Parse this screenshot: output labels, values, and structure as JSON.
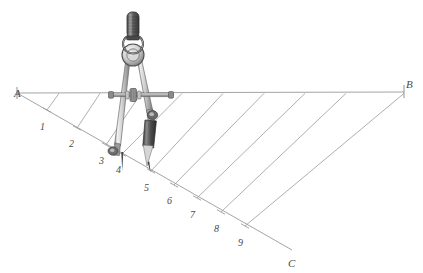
{
  "figure": {
    "background_color": "#ffffff",
    "line_color": "#9a9a9a",
    "label_color": "#4a4a4a",
    "instrument": "compass-divider"
  },
  "points": {
    "a": {
      "label": "A",
      "x": 14,
      "y": 88
    },
    "b": {
      "label": "B",
      "x": 406,
      "y": 79
    },
    "c": {
      "label": "C",
      "x": 288,
      "y": 258
    }
  },
  "segment_ab": {
    "x1": 17,
    "y1": 93,
    "x2": 404,
    "y2": 92
  },
  "ray_ac": {
    "x1": 17,
    "y1": 93,
    "x2": 292,
    "y2": 250
  },
  "divisions": [
    {
      "label": "1",
      "tick_x": 47,
      "tick_y": 110,
      "label_x": 40,
      "label_y": 122,
      "ab_x": 59
    },
    {
      "label": "2",
      "tick_x": 77,
      "tick_y": 128,
      "label_x": 69,
      "label_y": 139,
      "ab_x": 100
    },
    {
      "label": "3",
      "tick_x": 106,
      "tick_y": 145,
      "label_x": 99,
      "label_y": 156,
      "ab_x": 141
    },
    {
      "label": "4",
      "tick_x": 122,
      "tick_y": 154,
      "label_x": 116,
      "label_y": 165,
      "ab_x": 182
    },
    {
      "label": "5",
      "tick_x": 151,
      "tick_y": 171,
      "label_x": 144,
      "label_y": 183,
      "ab_x": 223
    },
    {
      "label": "6",
      "tick_x": 174,
      "tick_y": 185,
      "label_x": 167,
      "label_y": 196,
      "ab_x": 264
    },
    {
      "label": "7",
      "tick_x": 197,
      "tick_y": 198,
      "label_x": 190,
      "label_y": 210,
      "ab_x": 305
    },
    {
      "label": "8",
      "tick_x": 221,
      "tick_y": 212,
      "label_x": 214,
      "label_y": 224,
      "ab_x": 346
    },
    {
      "label": "9",
      "tick_x": 245,
      "tick_y": 226,
      "label_x": 238,
      "label_y": 238,
      "ab_x": 404
    }
  ],
  "compass": {
    "handle": "knurled-grip",
    "pivot": "hinge-disc",
    "left_leg_tip": "needle-point",
    "right_leg_tip": "pencil-lead-holder",
    "crossbar": "adjustment-bar",
    "knob": "adjustment-wheel",
    "needle_x": 122,
    "needle_y": 155,
    "pencil_x": 151,
    "pencil_y": 172
  }
}
